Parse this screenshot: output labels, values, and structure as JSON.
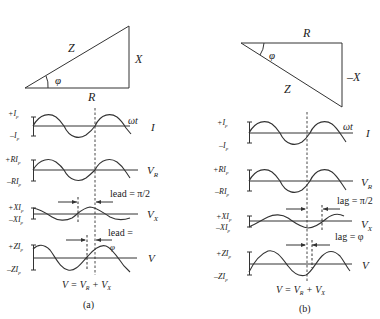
{
  "panels": [
    {
      "id": "a",
      "caption": "(a)",
      "triangle": {
        "hyp": "Z",
        "vert": "X",
        "base": "R",
        "angle": "φ"
      },
      "rows": [
        {
          "name": "I",
          "plus": "+I",
          "minus": "–I",
          "sub": "p",
          "right": "I",
          "right_sub": ""
        },
        {
          "name": "VR",
          "plus": "+RI",
          "minus": "–RI",
          "sub": "p",
          "right": "V",
          "right_sub": "R"
        },
        {
          "name": "VX",
          "plus": "+XI",
          "minus": "–XI",
          "sub": "p",
          "right": "V",
          "right_sub": "X"
        },
        {
          "name": "V",
          "plus": "+ZI",
          "minus": "–ZI",
          "sub": "p",
          "right": "V",
          "right_sub": ""
        }
      ],
      "omega_t": "ωt",
      "phase1": "lead = π/2",
      "phase2_line1": "lead =",
      "phase2_line2": "φ",
      "formula": {
        "lhs": "V = V",
        "s1": "R",
        "mid": " + V",
        "s2": "X"
      }
    },
    {
      "id": "b",
      "caption": "(b)",
      "triangle": {
        "hyp": "Z",
        "vert": "–X",
        "base": "R",
        "angle": "φ"
      },
      "rows": [
        {
          "name": "I",
          "plus": "+I",
          "minus": "–I",
          "sub": "p",
          "right": "I",
          "right_sub": ""
        },
        {
          "name": "VR",
          "plus": "+RI",
          "minus": "–RI",
          "sub": "p",
          "right": "V",
          "right_sub": "R"
        },
        {
          "name": "VX",
          "plus": "+XI",
          "minus": "–XI",
          "sub": "p",
          "right": "V",
          "right_sub": "X"
        },
        {
          "name": "V",
          "plus": "+ZI",
          "minus": "–ZI",
          "sub": "p",
          "right": "V",
          "right_sub": ""
        }
      ],
      "omega_t": "ωt",
      "phase1": "lag = π/2",
      "phase2": "lag = φ",
      "formula": {
        "lhs": "V = V",
        "s1": "R",
        "mid": " + V",
        "s2": "X"
      }
    }
  ]
}
